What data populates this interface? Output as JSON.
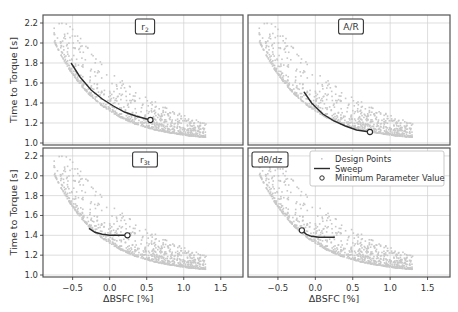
{
  "figure": {
    "ylabel": "Time to Torque   [s]",
    "xlabel": "ΔBSFC   [%]",
    "legend": {
      "items": [
        {
          "label": "Design Points",
          "kind": "points"
        },
        {
          "label": "Sweep",
          "kind": "line"
        },
        {
          "label": "Minimum Parameter Value",
          "kind": "marker"
        }
      ]
    },
    "colors": {
      "points": "#c8c8c8",
      "sweep": "#2b2b2b",
      "grid": "#d0d0d0",
      "frame": "#555555"
    }
  },
  "chart_data": [
    {
      "type": "line",
      "panel": "top-left",
      "title": "r2",
      "xlabel": "",
      "ylabel": "Time to Torque [s]",
      "xlim": [
        -0.9,
        1.8
      ],
      "ylim": [
        0.98,
        2.28
      ],
      "xticks": [
        -0.5,
        0.0,
        0.5,
        1.0,
        1.5
      ],
      "yticks": [
        1.0,
        1.2,
        1.4,
        1.6,
        1.8,
        2.0,
        2.2
      ],
      "grid": true,
      "series": [
        {
          "name": "Sweep",
          "x": [
            -0.52,
            -0.4,
            -0.25,
            -0.1,
            0.05,
            0.2,
            0.35,
            0.45,
            0.55
          ],
          "y": [
            1.8,
            1.66,
            1.53,
            1.44,
            1.37,
            1.31,
            1.27,
            1.25,
            1.23
          ]
        },
        {
          "name": "Minimum Parameter Value",
          "x": [
            0.55
          ],
          "y": [
            1.23
          ]
        }
      ]
    },
    {
      "type": "line",
      "panel": "top-right",
      "title": "A/R",
      "xlabel": "",
      "ylabel": "",
      "xlim": [
        -0.9,
        1.8
      ],
      "ylim": [
        0.98,
        2.28
      ],
      "xticks": [
        -0.5,
        0.0,
        0.5,
        1.0,
        1.5
      ],
      "yticks": [
        1.0,
        1.2,
        1.4,
        1.6,
        1.8,
        2.0,
        2.2
      ],
      "grid": true,
      "series": [
        {
          "name": "Sweep",
          "x": [
            -0.15,
            -0.05,
            0.1,
            0.25,
            0.4,
            0.55,
            0.73
          ],
          "y": [
            1.51,
            1.4,
            1.29,
            1.22,
            1.17,
            1.13,
            1.11
          ]
        },
        {
          "name": "Minimum Parameter Value",
          "x": [
            0.73
          ],
          "y": [
            1.11
          ]
        }
      ]
    },
    {
      "type": "line",
      "panel": "bottom-left",
      "title": "r3t",
      "xlabel": "ΔBSFC [%]",
      "ylabel": "Time to Torque [s]",
      "xlim": [
        -0.9,
        1.8
      ],
      "ylim": [
        0.98,
        2.28
      ],
      "xticks": [
        -0.5,
        0.0,
        0.5,
        1.0,
        1.5
      ],
      "yticks": [
        1.0,
        1.2,
        1.4,
        1.6,
        1.8,
        2.0,
        2.2
      ],
      "grid": true,
      "series": [
        {
          "name": "Sweep",
          "x": [
            -0.28,
            -0.2,
            -0.1,
            0.0,
            0.1,
            0.24
          ],
          "y": [
            1.47,
            1.43,
            1.41,
            1.4,
            1.4,
            1.4
          ]
        },
        {
          "name": "Minimum Parameter Value",
          "x": [
            0.24
          ],
          "y": [
            1.4
          ]
        }
      ]
    },
    {
      "type": "line",
      "panel": "bottom-right",
      "title": "dθ/dz",
      "xlabel": "ΔBSFC [%]",
      "ylabel": "",
      "xlim": [
        -0.9,
        1.8
      ],
      "ylim": [
        0.98,
        2.28
      ],
      "xticks": [
        -0.5,
        0.0,
        0.5,
        1.0,
        1.5
      ],
      "yticks": [
        1.0,
        1.2,
        1.4,
        1.6,
        1.8,
        2.0,
        2.2
      ],
      "grid": true,
      "legend": [
        "Design Points",
        "Sweep",
        "Minimum Parameter Value"
      ],
      "series": [
        {
          "name": "Sweep",
          "x": [
            -0.18,
            -0.12,
            -0.05,
            0.05,
            0.15,
            0.26
          ],
          "y": [
            1.45,
            1.41,
            1.39,
            1.38,
            1.38,
            1.38
          ]
        },
        {
          "name": "Minimum Parameter Value",
          "x": [
            -0.18
          ],
          "y": [
            1.45
          ]
        }
      ]
    }
  ]
}
